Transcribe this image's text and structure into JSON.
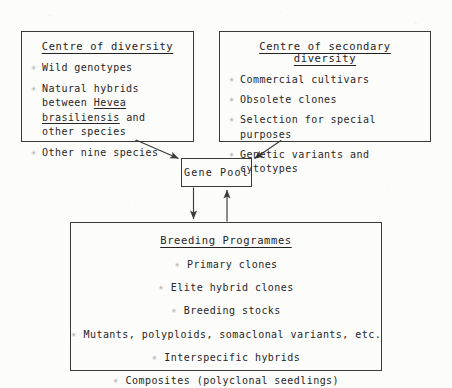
{
  "diagram": {
    "background_color": "#fcfcfb",
    "line_color": "#3a3a3a",
    "text_color": "#262626",
    "bullet_glyph": "✳",
    "centre_of_diversity": {
      "title": "Centre of diversity",
      "items": [
        {
          "text": "Wild genotypes"
        },
        {
          "text": "Natural hybrids between Hevea brasiliensis and other species"
        },
        {
          "text": "Other nine species"
        }
      ]
    },
    "centre_of_secondary_diversity": {
      "title": "Centre of secondary diversity",
      "items": [
        {
          "text": "Commercial cultivars"
        },
        {
          "text": "Obsolete clones"
        },
        {
          "text": "Selection for special purposes"
        },
        {
          "text": "Genetic variants and cytotypes"
        }
      ]
    },
    "gene_pool": {
      "label": "Gene Pool"
    },
    "breeding_programmes": {
      "title": "Breeding Programmes",
      "items": [
        {
          "text": "Primary clones"
        },
        {
          "text": "Elite hybrid clones"
        },
        {
          "text": "Breeding stocks"
        },
        {
          "text": "Mutants, polyploids, somaclonal variants, etc."
        },
        {
          "text": "Interspecific hybrids"
        },
        {
          "text": "Composites (polyclonal seedlings)"
        }
      ]
    },
    "connectors": [
      {
        "name": "diversity-to-genepool",
        "from": "centre_of_diversity",
        "to": "gene_pool",
        "direction": "down-right"
      },
      {
        "name": "secondary-to-genepool",
        "from": "centre_of_secondary_diversity",
        "to": "gene_pool",
        "direction": "down-left"
      },
      {
        "name": "genepool-to-breeding",
        "from": "gene_pool",
        "to": "breeding_programmes",
        "direction": "down"
      },
      {
        "name": "breeding-to-genepool",
        "from": "breeding_programmes",
        "to": "gene_pool",
        "direction": "up"
      }
    ],
    "hevea": {
      "prefix": "Natural hybrids between ",
      "species": "Hevea brasiliensis",
      "suffix": " and other species"
    }
  }
}
